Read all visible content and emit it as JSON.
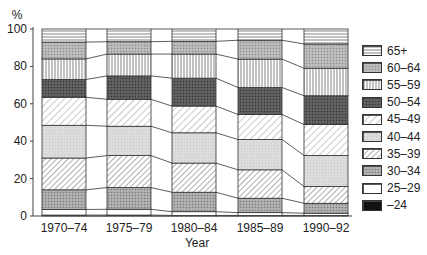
{
  "chart_data": {
    "type": "bar",
    "stacked": true,
    "percent_stacked": true,
    "title": "",
    "xlabel": "Year",
    "ylabel": "%",
    "ylim": [
      0,
      100
    ],
    "yticks": [
      0,
      20,
      40,
      60,
      80,
      100
    ],
    "grid": false,
    "legend_position": "right",
    "categories": [
      "1970–74",
      "1975–79",
      "1980–84",
      "1985–89",
      "1990–92"
    ],
    "series": [
      {
        "name": "–24",
        "values": [
          0.5,
          0.5,
          0.3,
          0.3,
          0.3
        ]
      },
      {
        "name": "25–29",
        "values": [
          3.0,
          3.1,
          2.0,
          1.5,
          1.2
        ]
      },
      {
        "name": "30–34",
        "values": [
          10.5,
          11.6,
          10.4,
          7.7,
          5.3
        ]
      },
      {
        "name": "35–39",
        "values": [
          17.0,
          17.1,
          15.6,
          15.2,
          9.0
        ]
      },
      {
        "name": "40–44",
        "values": [
          17.5,
          15.7,
          16.2,
          16.2,
          16.6
        ]
      },
      {
        "name": "45–49",
        "values": [
          15.0,
          14.4,
          14.3,
          13.4,
          16.5
        ]
      },
      {
        "name": "50–54",
        "values": [
          9.5,
          12.5,
          14.9,
          14.4,
          15.4
        ]
      },
      {
        "name": "55–59",
        "values": [
          11.0,
          11.7,
          12.9,
          15.2,
          14.7
        ]
      },
      {
        "name": "60–64",
        "values": [
          9.0,
          6.6,
          6.8,
          10.1,
          13.0
        ]
      },
      {
        "name": "65+",
        "values": [
          7.0,
          6.8,
          6.6,
          6.0,
          8.0
        ]
      }
    ]
  },
  "axis": {
    "y_unit": "%",
    "x_title": "Year"
  },
  "legend": {
    "items": [
      "65+",
      "60–64",
      "55–59",
      "50–54",
      "45–49",
      "40–44",
      "35–39",
      "30–34",
      "25–29",
      "–24"
    ]
  }
}
